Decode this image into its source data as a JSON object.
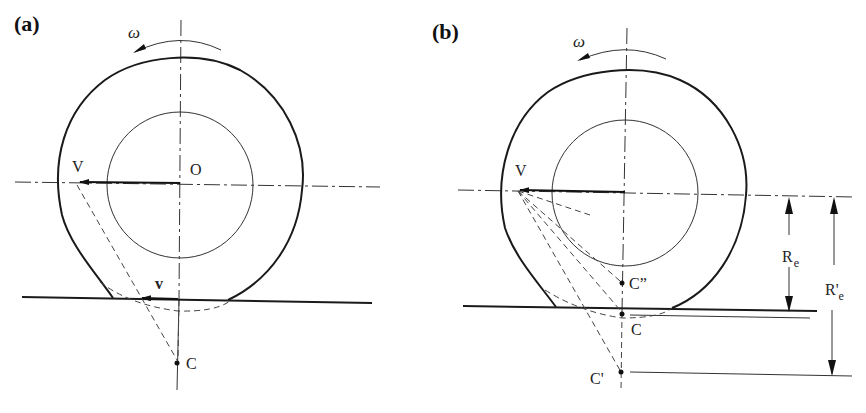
{
  "figure": {
    "panels": [
      {
        "id": "a",
        "label": "(a)",
        "omega_label": "ω",
        "center_label": "O",
        "velocity_label": "V",
        "contact_velocity_label": "v",
        "instant_center_label": "C"
      },
      {
        "id": "b",
        "label": "(b)",
        "omega_label": "ω",
        "velocity_label": "V",
        "points": {
          "c_double_prime": "C”",
          "c": "C",
          "c_prime": "C'"
        },
        "dimensions": {
          "re_main": "R",
          "re_sub": "e",
          "re_prime_main": "R'",
          "re_prime_sub": "e"
        }
      }
    ]
  }
}
